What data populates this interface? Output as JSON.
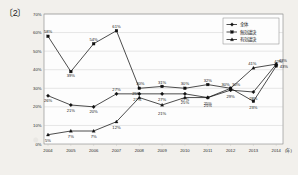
{
  "figure": {
    "label": "〔2〕"
  },
  "chart_data": {
    "type": "line",
    "title": "",
    "xlabel": "(年)",
    "ylabel": "",
    "x": [
      "2004",
      "2005",
      "2006",
      "2007",
      "2008",
      "2009",
      "2010",
      "2011",
      "2012",
      "2013",
      "2014"
    ],
    "categories": [
      "2004",
      "2005",
      "2006",
      "2007",
      "2008",
      "2009",
      "2010",
      "2011",
      "2012",
      "2013",
      "2014"
    ],
    "ylim": [
      0,
      70
    ],
    "yticks": [
      "0%",
      "10%",
      "20%",
      "30%",
      "40%",
      "50%",
      "60%",
      "70%"
    ],
    "ytick_values": [
      0,
      10,
      20,
      30,
      40,
      50,
      60,
      70
    ],
    "grid": true,
    "legend_position": "top-right",
    "series": [
      {
        "name": "全体",
        "marker": "diamond",
        "values": [
          26,
          21,
          20,
          27,
          27,
          27,
          27,
          25,
          29,
          28,
          43
        ],
        "labels": [
          "26%",
          "21%",
          "20%",
          "27%",
          "27%",
          "27%",
          "27%",
          "25%",
          "29%",
          "28%",
          "43%"
        ]
      },
      {
        "name": "無効議決",
        "marker": "square",
        "values": [
          58,
          39,
          54,
          61,
          30,
          31,
          30,
          32,
          30,
          23,
          42
        ],
        "labels": [
          "58%",
          "39%",
          "54%",
          "61%",
          "30%",
          "31%",
          "30%",
          "32%",
          "30%",
          "23%",
          "42%"
        ]
      },
      {
        "name": "有効議決",
        "marker": "triangle",
        "values": [
          5,
          7,
          7,
          12,
          25,
          21,
          25,
          25,
          30,
          41,
          43
        ],
        "labels": [
          "5%",
          "7%",
          "7%",
          "12%",
          "25%",
          "21%",
          "25%",
          "25%",
          "30%",
          "41%",
          "43%"
        ]
      }
    ]
  }
}
